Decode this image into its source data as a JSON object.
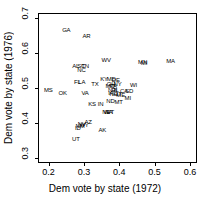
{
  "chart_data": {
    "type": "scatter",
    "title": "",
    "xlabel": "Dem vote by state (1972)",
    "ylabel": "Dem vote by state (1976)",
    "xlim": [
      0.17,
      0.62
    ],
    "ylim": [
      0.285,
      0.715
    ],
    "xticks": [
      "0.2",
      "0.3",
      "0.4",
      "0.5",
      "0.6"
    ],
    "xtick_values": [
      0.2,
      0.3,
      0.4,
      0.5,
      0.6
    ],
    "yticks": [
      "0.3",
      "0.4",
      "0.5",
      "0.6",
      "0.7"
    ],
    "ytick_values": [
      0.3,
      0.4,
      0.5,
      0.6,
      0.7
    ],
    "grid": false,
    "legend": false,
    "marker_style": "text-labels",
    "points": [
      {
        "label": "GA",
        "x": 0.25,
        "y": 0.665
      },
      {
        "label": "AR",
        "x": 0.307,
        "y": 0.648
      },
      {
        "label": "WV",
        "x": 0.363,
        "y": 0.58
      },
      {
        "label": "MA",
        "x": 0.545,
        "y": 0.578
      },
      {
        "label": "MN",
        "x": 0.466,
        "y": 0.575
      },
      {
        "label": "MI",
        "x": 0.47,
        "y": 0.572
      },
      {
        "label": "AL",
        "x": 0.277,
        "y": 0.562
      },
      {
        "label": "SC",
        "x": 0.292,
        "y": 0.562
      },
      {
        "label": "TN",
        "x": 0.303,
        "y": 0.562
      },
      {
        "label": "NC",
        "x": 0.293,
        "y": 0.551
      },
      {
        "label": "KY",
        "x": 0.357,
        "y": 0.527
      },
      {
        "label": "MD",
        "x": 0.377,
        "y": 0.525
      },
      {
        "label": "DE",
        "x": 0.39,
        "y": 0.523
      },
      {
        "label": "FL",
        "x": 0.281,
        "y": 0.518
      },
      {
        "label": "LA",
        "x": 0.294,
        "y": 0.518
      },
      {
        "label": "TX",
        "x": 0.331,
        "y": 0.512
      },
      {
        "label": "OH",
        "x": 0.377,
        "y": 0.512
      },
      {
        "label": "NY",
        "x": 0.395,
        "y": 0.512
      },
      {
        "label": "WI",
        "x": 0.44,
        "y": 0.508
      },
      {
        "label": "MO",
        "x": 0.374,
        "y": 0.506
      },
      {
        "label": "PA",
        "x": 0.383,
        "y": 0.505
      },
      {
        "label": "MS",
        "x": 0.199,
        "y": 0.495
      },
      {
        "label": "NJ",
        "x": 0.378,
        "y": 0.494
      },
      {
        "label": "RI",
        "x": 0.386,
        "y": 0.494
      },
      {
        "label": "IL",
        "x": 0.392,
        "y": 0.493
      },
      {
        "label": "CA",
        "x": 0.413,
        "y": 0.49
      },
      {
        "label": "SD",
        "x": 0.428,
        "y": 0.49
      },
      {
        "label": "OK",
        "x": 0.24,
        "y": 0.486
      },
      {
        "label": "VA",
        "x": 0.303,
        "y": 0.486
      },
      {
        "label": "IA",
        "x": 0.376,
        "y": 0.485
      },
      {
        "label": "NH",
        "x": 0.384,
        "y": 0.482
      },
      {
        "label": "CT",
        "x": 0.396,
        "y": 0.482
      },
      {
        "label": "ME",
        "x": 0.404,
        "y": 0.481
      },
      {
        "label": "MI2",
        "x": 0.424,
        "y": 0.472
      },
      {
        "label": "ND",
        "x": 0.375,
        "y": 0.463
      },
      {
        "label": "MT",
        "x": 0.398,
        "y": 0.461
      },
      {
        "label": "KS",
        "x": 0.323,
        "y": 0.455
      },
      {
        "label": "IN",
        "x": 0.347,
        "y": 0.455
      },
      {
        "label": "NE",
        "x": 0.363,
        "y": 0.432
      },
      {
        "label": "VT",
        "x": 0.375,
        "y": 0.432
      },
      {
        "label": "WA",
        "x": 0.368,
        "y": 0.43
      },
      {
        "label": "AZ",
        "x": 0.312,
        "y": 0.403
      },
      {
        "label": "NV",
        "x": 0.294,
        "y": 0.396
      },
      {
        "label": "WY",
        "x": 0.3,
        "y": 0.393
      },
      {
        "label": "NM",
        "x": 0.289,
        "y": 0.391
      },
      {
        "label": "ID",
        "x": 0.283,
        "y": 0.384
      },
      {
        "label": "AK",
        "x": 0.352,
        "y": 0.381
      },
      {
        "label": "UT",
        "x": 0.277,
        "y": 0.355
      }
    ]
  }
}
